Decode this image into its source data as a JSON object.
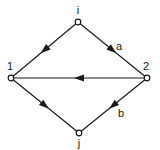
{
  "diagram": {
    "type": "directed-graph",
    "nodes": [
      {
        "id": "i",
        "label": "i",
        "x": 78,
        "y": 22,
        "lx": 78,
        "ly": 14
      },
      {
        "id": "1",
        "label": "1",
        "x": 11,
        "y": 78,
        "lx": 10,
        "ly": 70
      },
      {
        "id": "2",
        "label": "2",
        "x": 147,
        "y": 78,
        "lx": 146,
        "ly": 70
      },
      {
        "id": "j",
        "label": "j",
        "x": 79,
        "y": 133,
        "lx": 79,
        "ly": 147
      }
    ],
    "edges": [
      {
        "from": "i",
        "to": "1",
        "label": ""
      },
      {
        "from": "i",
        "to": "2",
        "label": "a",
        "lx": 119,
        "ly": 50
      },
      {
        "from": "2",
        "to": "1",
        "label": ""
      },
      {
        "from": "1",
        "to": "j",
        "label": ""
      },
      {
        "from": "2",
        "to": "j",
        "label": "b",
        "lx": 121,
        "ly": 117
      }
    ],
    "colors": {
      "stroke": "#1a1a1a",
      "node_fill": "#ffffff"
    }
  }
}
